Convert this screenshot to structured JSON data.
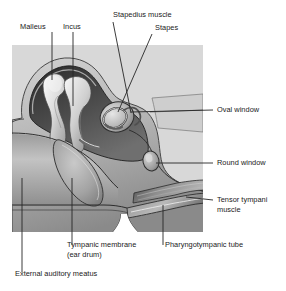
{
  "figure": {
    "panel": {
      "background_color": "#d8d8d8",
      "x": 12,
      "y": 45,
      "width": 191,
      "height": 187
    },
    "page_background_color": "#ffffff",
    "text_color": "#1a1a1a",
    "leader_line_color": "#262626"
  },
  "labels": [
    {
      "id": "malleus",
      "text": "Malleus",
      "position": "top-left",
      "lines": [
        "Malleus"
      ]
    },
    {
      "id": "incus",
      "text": "Incus",
      "position": "top-left",
      "lines": [
        "Incus"
      ]
    },
    {
      "id": "stapedius-muscle",
      "text": "Stapedius muscle",
      "position": "top-center",
      "lines": [
        "Stapedius muscle"
      ]
    },
    {
      "id": "stapes",
      "text": "Stapes",
      "position": "top-center",
      "lines": [
        "Stapes"
      ]
    },
    {
      "id": "oval-window",
      "text": "Oval window",
      "position": "right",
      "lines": [
        "Oval window"
      ]
    },
    {
      "id": "round-window",
      "text": "Round window",
      "position": "right",
      "lines": [
        "Round window"
      ]
    },
    {
      "id": "tensor-tympani-muscle",
      "text": "Tensor tympani muscle",
      "position": "right",
      "lines": [
        "Tensor tympani",
        "muscle"
      ]
    },
    {
      "id": "tympanic-membrane",
      "text": "Tympanic membrane (ear drum)",
      "position": "bottom",
      "lines": [
        "Tympanic membrane",
        "(ear drum)"
      ]
    },
    {
      "id": "pharyngotympanic-tube",
      "text": "Pharyngotympanic tube",
      "position": "bottom",
      "lines": [
        "Pharyngotympanic tube"
      ]
    },
    {
      "id": "external-auditory-meatus",
      "text": "External auditory meatus",
      "position": "bottom-left",
      "lines": [
        "External auditory meatus"
      ]
    }
  ],
  "label_text": {
    "malleus": "Malleus",
    "incus": "Incus",
    "stapedius_muscle": "Stapedius muscle",
    "stapes": "Stapes",
    "oval_window": "Oval window",
    "round_window": "Round window",
    "tensor_tympani_l1": "Tensor tympani",
    "tensor_tympani_l2": "muscle",
    "tympanic_membrane_l1": "Tympanic membrane",
    "tympanic_membrane_l2": "(ear drum)",
    "pharyngotympanic_tube": "Pharyngotympanic tube",
    "external_auditory_meatus": "External auditory meatus"
  },
  "structures": [
    {
      "id": "middle-ear-cavity",
      "name": "Middle ear cavity (tympanic cavity)"
    },
    {
      "id": "malleus-bone",
      "name": "Malleus ossicle"
    },
    {
      "id": "incus-bone",
      "name": "Incus ossicle"
    },
    {
      "id": "stapes-bone",
      "name": "Stapes ossicle in oval window"
    },
    {
      "id": "tympanic-membrane-shape",
      "name": "Tympanic membrane"
    },
    {
      "id": "external-auditory-canal",
      "name": "External auditory meatus canal"
    },
    {
      "id": "round-window-shape",
      "name": "Round window"
    },
    {
      "id": "pharyngotympanic-tube-shape",
      "name": "Pharyngotympanic (Eustachian) tube"
    },
    {
      "id": "tensor-tympani-shape",
      "name": "Tensor tympani muscle"
    }
  ]
}
